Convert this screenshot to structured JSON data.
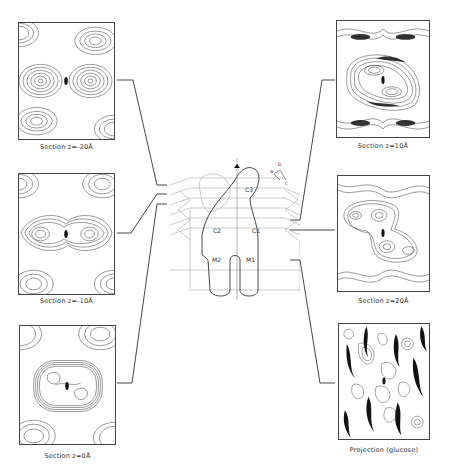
{
  "figure": {
    "panels": [
      {
        "id": "section-z-minus-20",
        "caption": "Section z=-20Å",
        "side": "left",
        "row": 0
      },
      {
        "id": "section-z-minus-10",
        "caption": "Section z=-10Å",
        "side": "left",
        "row": 1
      },
      {
        "id": "section-z-0",
        "caption": "Section z=0Å",
        "side": "left",
        "row": 2
      },
      {
        "id": "section-z-10",
        "caption": "Section z=10Å",
        "side": "right",
        "row": 0
      },
      {
        "id": "section-z-20",
        "caption": "Section z=20Å",
        "side": "right",
        "row": 1
      },
      {
        "id": "projection-glucose",
        "caption": "Projection (glucose)",
        "side": "right",
        "row": 2
      }
    ],
    "center_diagram": {
      "domain_labels": [
        "C3",
        "C2",
        "C1",
        "M2",
        "M1"
      ],
      "axis_labels": [
        "a",
        "b",
        "c"
      ]
    }
  }
}
